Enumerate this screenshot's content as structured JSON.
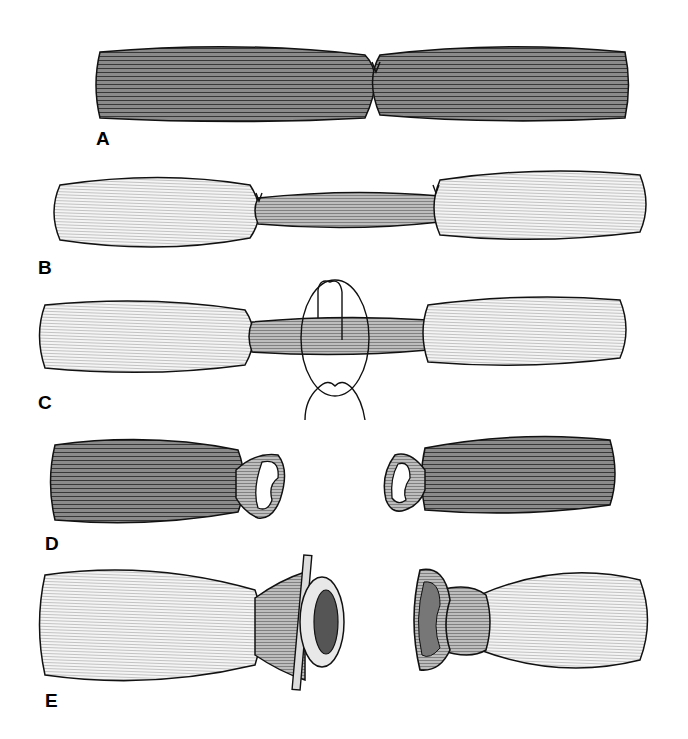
{
  "figure": {
    "type": "line-art illustration",
    "colors": {
      "ink": "#111111",
      "dark_fill": "#5a5a5a",
      "light_fill": "#d6d6d6",
      "background": "#ffffff"
    }
  },
  "panels": [
    {
      "label": "A",
      "description": "Two dark bowel segments joined at a central suture"
    },
    {
      "label": "B",
      "description": "Two light segments joined by a narrow middle segment, sutures at each junction"
    },
    {
      "label": "C",
      "description": "Same as B with loop of suture/ligature encircling middle segment"
    },
    {
      "label": "D",
      "description": "Two dark segments with everted open cuffs facing each other"
    },
    {
      "label": "E",
      "description": "Light segments: left with ring device and bar, right with open everted cuff"
    }
  ]
}
